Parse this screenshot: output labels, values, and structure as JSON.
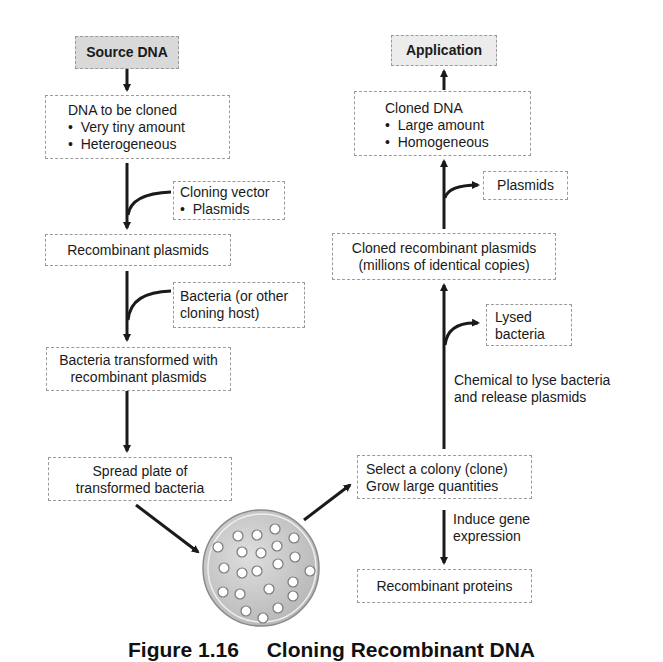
{
  "diagram": {
    "left_column": {
      "source": {
        "label": "Source DNA"
      },
      "dna_to_clone": {
        "title": "DNA to be cloned",
        "bullets": [
          "Very tiny amount",
          "Heterogeneous"
        ]
      },
      "cloning_vector": {
        "title": "Cloning vector",
        "bullets": [
          "Plasmids"
        ]
      },
      "recombinant_plasmids": {
        "label": "Recombinant plasmids"
      },
      "host": {
        "lines": [
          "Bacteria (or other",
          "cloning host)"
        ]
      },
      "transformed": {
        "lines": [
          "Bacteria transformed with",
          "recombinant plasmids"
        ]
      },
      "spread_plate": {
        "lines": [
          "Spread plate of",
          "transformed bacteria"
        ]
      }
    },
    "petri_dish": {
      "colony_count": 25
    },
    "right_column": {
      "application": {
        "label": "Application"
      },
      "cloned_dna": {
        "title": "Cloned DNA",
        "bullets": [
          "Large amount",
          "Homogeneous"
        ]
      },
      "plasmids_out": {
        "label": "Plasmids"
      },
      "cloned_recombinant": {
        "lines": [
          "Cloned recombinant plasmids",
          "(millions of identical copies)"
        ]
      },
      "lysed": {
        "lines": [
          "Lysed",
          "bacteria"
        ]
      },
      "chemical_step": {
        "lines": [
          "Chemical to lyse bacteria",
          "and release plasmids"
        ]
      },
      "select_colony": {
        "lines": [
          "Select a colony (clone)",
          "Grow large quantities"
        ]
      },
      "induce": {
        "lines": [
          "Induce gene",
          "expression"
        ]
      },
      "proteins": {
        "label": "Recombinant proteins"
      }
    },
    "bullet_char": "•",
    "colors": {
      "source_fill": "#d9d9d9",
      "application_fill": "#ececec",
      "box_border": "#9a9a9a",
      "arrow": "#1a1a1a",
      "dish_fill": "#c8c8c8"
    }
  },
  "caption": {
    "number": "Figure 1.16",
    "title": "Cloning Recombinant DNA"
  }
}
